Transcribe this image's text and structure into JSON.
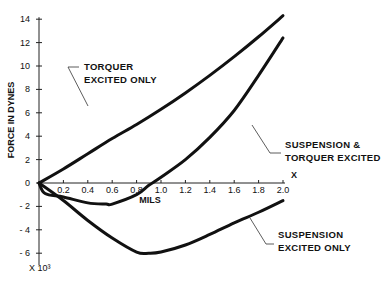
{
  "chart_data": {
    "type": "line",
    "title": "",
    "xlabel": "MILS",
    "ylabel": "FORCE IN DYNES",
    "y_multiplier_label": "X 10³",
    "x_axis_end_label": "X",
    "xlim": [
      0,
      2.0
    ],
    "ylim": [
      -6,
      14
    ],
    "x_ticks": [
      "0.2",
      "0.4",
      "0.6",
      "0.8",
      "1.0",
      "1.2",
      "1.4",
      "1.6",
      "1.8",
      "2.0"
    ],
    "y_ticks": [
      "14",
      "12",
      "10",
      "8",
      "6",
      "4",
      "2",
      "0",
      "-2",
      "-4",
      "-6"
    ],
    "grid": false,
    "legend": "inline annotations",
    "series": [
      {
        "name": "TORQUER EXCITED ONLY",
        "x": [
          0,
          0.2,
          0.4,
          0.6,
          0.8,
          1.0,
          1.2,
          1.4,
          1.6,
          1.8,
          2.0
        ],
        "values": [
          0,
          1.2,
          2.5,
          3.8,
          5.0,
          6.3,
          7.7,
          9.2,
          10.8,
          12.5,
          14.3
        ]
      },
      {
        "name": "SUSPENSION & TORQUER EXCITED",
        "x": [
          0,
          0.05,
          0.2,
          0.4,
          0.55,
          0.6,
          0.8,
          0.9,
          1.0,
          1.2,
          1.4,
          1.6,
          1.8,
          2.0
        ],
        "values": [
          0,
          -0.9,
          -1.2,
          -1.7,
          -1.8,
          -1.8,
          -1.0,
          -0.2,
          0.5,
          2.0,
          3.9,
          6.2,
          9.2,
          12.4
        ]
      },
      {
        "name": "SUSPENSION EXCITED ONLY",
        "x": [
          0,
          0.2,
          0.4,
          0.6,
          0.8,
          0.9,
          1.0,
          1.2,
          1.4,
          1.6,
          1.8,
          2.0
        ],
        "values": [
          0,
          -1.5,
          -3.2,
          -4.7,
          -5.9,
          -6.0,
          -5.9,
          -5.3,
          -4.4,
          -3.4,
          -2.5,
          -1.5
        ]
      }
    ],
    "annotations": [
      {
        "lines": [
          "TORQUER",
          "EXCITED ONLY"
        ]
      },
      {
        "lines": [
          "SUSPENSION &",
          "TORQUER EXCITED"
        ]
      },
      {
        "lines": [
          "SUSPENSION",
          "EXCITED ONLY"
        ]
      }
    ]
  }
}
